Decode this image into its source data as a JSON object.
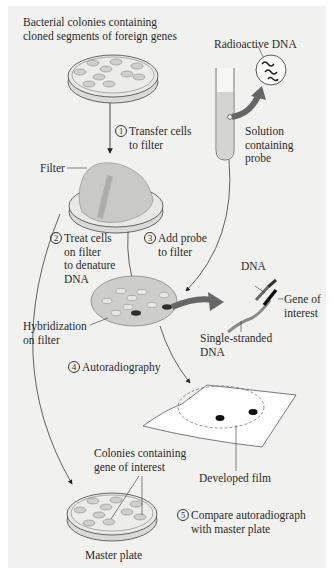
{
  "labels": {
    "colonies_top": [
      "Bacterial colonies containing",
      "cloned segments of foreign genes"
    ],
    "radioactive_dna": "Radioactive DNA",
    "solution": [
      "Solution",
      "containing",
      "probe"
    ],
    "filter": "Filter",
    "hybridization": [
      "Hybridization",
      "on filter"
    ],
    "dna": "DNA",
    "gene_of_interest": [
      "Gene of",
      "interest"
    ],
    "single_stranded": [
      "Single-stranded",
      "DNA"
    ],
    "developed_film": "Developed film",
    "colonies_gene": [
      "Colonies containing",
      "gene of interest"
    ],
    "master_plate": "Master plate"
  },
  "steps": [
    {
      "num": "1",
      "lines": [
        "Transfer cells",
        "to filter"
      ]
    },
    {
      "num": "2",
      "lines": [
        "Treat cells",
        "on filter",
        "to denature",
        "DNA"
      ]
    },
    {
      "num": "3",
      "lines": [
        "Add probe",
        "to filter"
      ]
    },
    {
      "num": "4",
      "lines": [
        "Autoradiography"
      ]
    },
    {
      "num": "5",
      "lines": [
        "Compare autoradiograph",
        "with master plate"
      ]
    }
  ],
  "colors": {
    "background": "#f1f1ef",
    "plate_fill": "#e4e4e2",
    "colony_fill": "#cfcfcb",
    "filter_fill": "#c9c9c6",
    "probe_arrow": "#6a6a6a",
    "hybrid_spot": "#3a3a3a",
    "film": "#ffffff"
  }
}
